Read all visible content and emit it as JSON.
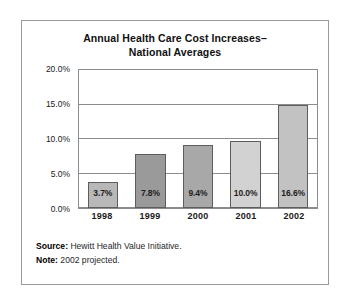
{
  "chart_data": {
    "type": "bar",
    "title": "Annual Health Care Cost Increases– National Averages",
    "title_line1": "Annual Health Care Cost Increases–",
    "title_line2": "National Averages",
    "xlabel": "",
    "ylabel": "",
    "ylim": [
      0,
      20
    ],
    "grid": true,
    "legend": "none",
    "categories": [
      "1998",
      "1999",
      "2000",
      "2001",
      "2002"
    ],
    "values": [
      3.7,
      7.8,
      9.4,
      10.0,
      16.6
    ],
    "value_labels": [
      "3.7%",
      "7.8%",
      "9.4%",
      "10.0%",
      "16.6%"
    ],
    "drawn_heights_pct": [
      3.7,
      7.8,
      9.1,
      9.7,
      15.0
    ],
    "bar_colors": [
      "#b8b8b8",
      "#9a9a9a",
      "#a8a8a8",
      "#d2d2d2",
      "#c2c2c2"
    ],
    "ytick_labels": [
      "0.0%",
      "5.0%",
      "10.0%",
      "15.0%",
      "20.0%"
    ],
    "ytick_values": [
      0,
      5,
      10,
      15,
      20
    ],
    "series": [
      {
        "name": "Annual increase",
        "values": [
          3.7,
          7.8,
          9.4,
          10.0,
          16.6
        ]
      }
    ],
    "annotations": [
      "Source: Hewitt Health Value Initiative.",
      "Note: 2002 projected."
    ]
  },
  "footnotes": [
    {
      "lead": "Source:",
      "text": " Hewitt Health Value Initiative."
    },
    {
      "lead": "Note:",
      "text": " 2002 projected."
    }
  ],
  "colors": {
    "frame": "#9a9a9a",
    "axis": "#8c8c8c",
    "bar_outline": "#5d5d5d",
    "text": "#1a1a1a",
    "background": "#ffffff"
  }
}
